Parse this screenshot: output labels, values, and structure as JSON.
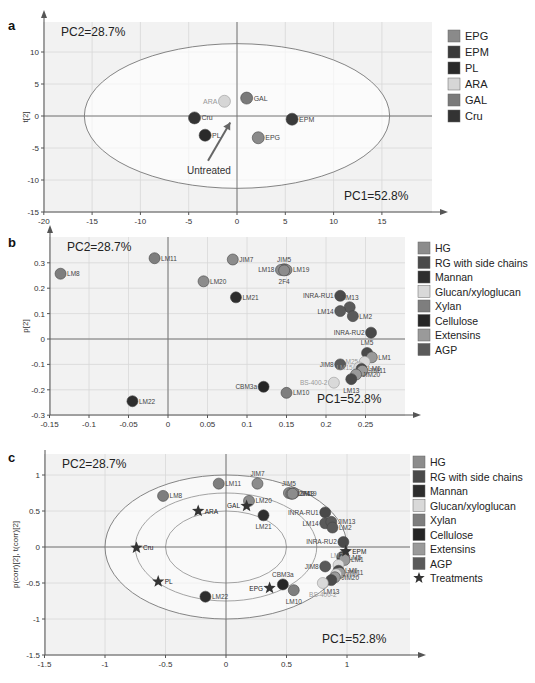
{
  "figure": {
    "panels": [
      "a",
      "b",
      "c"
    ],
    "pc1_label": "PC1=52.8%",
    "pc2_label": "PC2=28.7%"
  },
  "colors": {
    "EPG": "#8a8a8a",
    "EPM": "#3a3a3a",
    "PL": "#2a2a2a",
    "ARA": "#d6d6d6",
    "GAL": "#7a7a7a",
    "Cru": "#333333",
    "HG": "#8c8c8c",
    "RG with side chains": "#4a4a4a",
    "Mannan": "#2e2e2e",
    "Glucan/xyloglucan": "#d9d9d9",
    "Xylan": "#7e7e7e",
    "Cellulose": "#262626",
    "Extensins": "#9a9a9a",
    "AGP": "#5a5a5a",
    "Treatments": "#333333"
  },
  "chart_data": [
    {
      "panel": "a",
      "type": "scatter",
      "title": "",
      "xlabel": "",
      "ylabel": "t[2]",
      "xlim": [
        -20,
        19
      ],
      "ylim": [
        -15,
        14
      ],
      "xticks": [
        -20,
        -15,
        -10,
        -5,
        0,
        5,
        10,
        15
      ],
      "yticks": [
        -15,
        -10,
        -5,
        0,
        5,
        10
      ],
      "grid": true,
      "annotations": [
        "PC1=52.8%",
        "PC2=28.7%",
        "Untreated"
      ],
      "ellipse": {
        "cx": 0,
        "cy": 0,
        "rx": 15.8,
        "ry": 11.3
      },
      "legend": [
        "EPG",
        "EPM",
        "PL",
        "ARA",
        "GAL",
        "Cru"
      ],
      "legend_position": "right",
      "points": [
        {
          "label": "ARA",
          "x": -1.3,
          "y": 2.3,
          "group": "ARA"
        },
        {
          "label": "GAL",
          "x": 1.0,
          "y": 2.8,
          "group": "GAL"
        },
        {
          "label": "Cru",
          "x": -4.4,
          "y": -0.3,
          "group": "Cru"
        },
        {
          "label": "PL",
          "x": -3.3,
          "y": -3.0,
          "group": "PL"
        },
        {
          "label": "EPG",
          "x": 2.2,
          "y": -3.4,
          "group": "EPG"
        },
        {
          "label": "EPM",
          "x": 5.7,
          "y": -0.5,
          "group": "EPM"
        }
      ],
      "arrow": {
        "from": [
          -3,
          -7
        ],
        "to": [
          -0.7,
          -1.0
        ],
        "label": "Untreated"
      }
    },
    {
      "panel": "b",
      "type": "scatter",
      "title": "",
      "xlabel": "",
      "ylabel": "p[2]",
      "xlim": [
        -0.15,
        0.29
      ],
      "ylim": [
        -0.3,
        0.38
      ],
      "xticks": [
        -0.15,
        -0.1,
        -0.05,
        0,
        0.05,
        0.1,
        0.15,
        0.2,
        0.25
      ],
      "yticks": [
        -0.3,
        -0.2,
        -0.1,
        0,
        0.1,
        0.2,
        0.3
      ],
      "grid": true,
      "annotations": [
        "PC1=52.8%",
        "PC2=28.7%"
      ],
      "legend": [
        "HG",
        "RG with side chains",
        "Mannan",
        "Glucan/xyloglucan",
        "Xylan",
        "Cellulose",
        "Extensins",
        "AGP"
      ],
      "legend_position": "right",
      "points": [
        {
          "label": "LM8",
          "x": -0.136,
          "y": 0.257,
          "group": "Xylan"
        },
        {
          "label": "LM11",
          "x": -0.017,
          "y": 0.318,
          "group": "Xylan"
        },
        {
          "label": "JIM7",
          "x": 0.082,
          "y": 0.313,
          "group": "HG"
        },
        {
          "label": "LM20",
          "x": 0.045,
          "y": 0.227,
          "group": "HG"
        },
        {
          "label": "LM21",
          "x": 0.086,
          "y": 0.164,
          "group": "Mannan"
        },
        {
          "label": "JIM5",
          "x": 0.147,
          "y": 0.275,
          "group": "HG"
        },
        {
          "label": "LM18",
          "x": 0.143,
          "y": 0.272,
          "group": "HG"
        },
        {
          "label": "LM19",
          "x": 0.15,
          "y": 0.272,
          "group": "HG"
        },
        {
          "label": "2F4",
          "x": 0.147,
          "y": 0.27,
          "group": "HG"
        },
        {
          "label": "INRA-RU1",
          "x": 0.218,
          "y": 0.17,
          "group": "RG with side chains"
        },
        {
          "label": "JIM13",
          "x": 0.23,
          "y": 0.125,
          "group": "AGP"
        },
        {
          "label": "LM14",
          "x": 0.218,
          "y": 0.11,
          "group": "AGP"
        },
        {
          "label": "LM2",
          "x": 0.234,
          "y": 0.09,
          "group": "AGP"
        },
        {
          "label": "INRA-RU2",
          "x": 0.257,
          "y": 0.025,
          "group": "RG with side chains"
        },
        {
          "label": "LM5",
          "x": 0.252,
          "y": -0.055,
          "group": "RG with side chains"
        },
        {
          "label": "LM1",
          "x": 0.258,
          "y": -0.072,
          "group": "Extensins"
        },
        {
          "label": "LM25",
          "x": 0.249,
          "y": -0.09,
          "group": "Glucan/xyloglucan"
        },
        {
          "label": "JIM8",
          "x": 0.218,
          "y": -0.1,
          "group": "AGP"
        },
        {
          "label": "LM15",
          "x": 0.242,
          "y": -0.112,
          "group": "Glucan/xyloglucan"
        },
        {
          "label": "LM6",
          "x": 0.245,
          "y": -0.118,
          "group": "RG with side chains"
        },
        {
          "label": "JIM11",
          "x": 0.246,
          "y": -0.125,
          "group": "Extensins"
        },
        {
          "label": "JIM20",
          "x": 0.238,
          "y": -0.14,
          "group": "Extensins"
        },
        {
          "label": "LM13",
          "x": 0.232,
          "y": -0.158,
          "group": "RG with side chains"
        },
        {
          "label": "BS-400-2",
          "x": 0.21,
          "y": -0.172,
          "group": "Glucan/xyloglucan"
        },
        {
          "label": "CBM3a",
          "x": 0.121,
          "y": -0.188,
          "group": "Cellulose"
        },
        {
          "label": "LM10",
          "x": 0.15,
          "y": -0.212,
          "group": "Xylan"
        },
        {
          "label": "LM22",
          "x": -0.045,
          "y": -0.245,
          "group": "Mannan"
        }
      ]
    },
    {
      "panel": "c",
      "type": "scatter",
      "title": "",
      "xlabel": "",
      "ylabel": "p(corr)[2], t(corr)[2]",
      "xlim": [
        -1.5,
        1.45
      ],
      "ylim": [
        -1.5,
        1.3
      ],
      "xticks": [
        -1.5,
        -1,
        -0.5,
        0,
        0.5,
        1
      ],
      "yticks": [
        -1.5,
        -1,
        -0.5,
        0,
        0.5,
        1
      ],
      "grid": true,
      "annotations": [
        "PC1=52.8%",
        "PC2=28.7%"
      ],
      "ellipses": [
        {
          "cx": 0,
          "cy": 0,
          "rx": 1.0,
          "ry": 1.0
        },
        {
          "cx": 0,
          "cy": 0,
          "rx": 0.75,
          "ry": 0.75
        },
        {
          "cx": 0,
          "cy": 0,
          "rx": 0.5,
          "ry": 0.5
        }
      ],
      "legend": [
        "HG",
        "RG with side chains",
        "Mannan",
        "Glucan/xyloglucan",
        "Xylan",
        "Cellulose",
        "Extensins",
        "AGP",
        "Treatments"
      ],
      "legend_position": "right",
      "points": [
        {
          "label": "LM8",
          "x": -0.52,
          "y": 0.71,
          "group": "Xylan"
        },
        {
          "label": "LM11",
          "x": -0.06,
          "y": 0.88,
          "group": "Xylan"
        },
        {
          "label": "JIM7",
          "x": 0.26,
          "y": 0.88,
          "group": "HG"
        },
        {
          "label": "LM20",
          "x": 0.19,
          "y": 0.64,
          "group": "HG"
        },
        {
          "label": "LM21",
          "x": 0.31,
          "y": 0.44,
          "group": "Mannan"
        },
        {
          "label": "JIM5",
          "x": 0.52,
          "y": 0.75,
          "group": "HG"
        },
        {
          "label": "LM19",
          "x": 0.56,
          "y": 0.75,
          "group": "HG"
        },
        {
          "label": "LM18",
          "x": 0.54,
          "y": 0.74,
          "group": "HG"
        },
        {
          "label": "2F4",
          "x": 0.55,
          "y": 0.74,
          "group": "HG"
        },
        {
          "label": "INRA-RU1",
          "x": 0.82,
          "y": 0.48,
          "group": "RG with side chains"
        },
        {
          "label": "LM14",
          "x": 0.82,
          "y": 0.33,
          "group": "AGP"
        },
        {
          "label": "JIM13",
          "x": 0.87,
          "y": 0.35,
          "group": "AGP"
        },
        {
          "label": "LM2",
          "x": 0.88,
          "y": 0.27,
          "group": "AGP"
        },
        {
          "label": "INRA-RU2",
          "x": 0.97,
          "y": 0.07,
          "group": "RG with side chains"
        },
        {
          "label": "LM5",
          "x": 0.96,
          "y": -0.14,
          "group": "RG with side chains"
        },
        {
          "label": "LM1",
          "x": 0.98,
          "y": -0.18,
          "group": "Extensins"
        },
        {
          "label": "LM25",
          "x": 0.93,
          "y": -0.25,
          "group": "Glucan/xyloglucan"
        },
        {
          "label": "JIM8",
          "x": 0.82,
          "y": -0.27,
          "group": "AGP"
        },
        {
          "label": "LM6",
          "x": 0.93,
          "y": -0.33,
          "group": "RG with side chains"
        },
        {
          "label": "JIM11",
          "x": 0.94,
          "y": -0.36,
          "group": "Extensins"
        },
        {
          "label": "LM15",
          "x": 0.91,
          "y": -0.38,
          "group": "Glucan/xyloglucan"
        },
        {
          "label": "JIM20",
          "x": 0.9,
          "y": -0.42,
          "group": "Extensins"
        },
        {
          "label": "LM13",
          "x": 0.87,
          "y": -0.46,
          "group": "RG with side chains"
        },
        {
          "label": "BS-400-2",
          "x": 0.8,
          "y": -0.5,
          "group": "Glucan/xyloglucan"
        },
        {
          "label": "CBM3a",
          "x": 0.47,
          "y": -0.52,
          "group": "Cellulose"
        },
        {
          "label": "LM10",
          "x": 0.56,
          "y": -0.6,
          "group": "Xylan"
        },
        {
          "label": "LM22",
          "x": -0.17,
          "y": -0.69,
          "group": "Mannan"
        },
        {
          "label": "ARA",
          "x": -0.23,
          "y": 0.5,
          "group": "Treatments",
          "marker": "star"
        },
        {
          "label": "GAL",
          "x": 0.17,
          "y": 0.57,
          "group": "Treatments",
          "marker": "star"
        },
        {
          "label": "Cru",
          "x": -0.74,
          "y": -0.01,
          "group": "Treatments",
          "marker": "star"
        },
        {
          "label": "PL",
          "x": -0.56,
          "y": -0.48,
          "group": "Treatments",
          "marker": "star"
        },
        {
          "label": "EPG",
          "x": 0.36,
          "y": -0.57,
          "group": "Treatments",
          "marker": "star"
        },
        {
          "label": "EPM",
          "x": 0.99,
          "y": -0.06,
          "group": "Treatments",
          "marker": "star"
        }
      ]
    }
  ]
}
